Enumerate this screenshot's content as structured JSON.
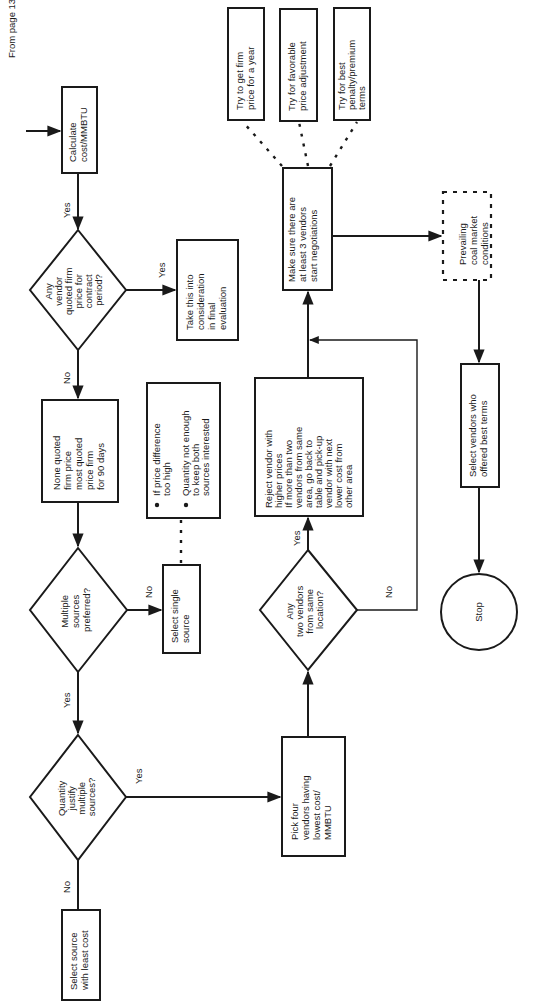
{
  "flowchart": {
    "entry_label": "From page 133",
    "nodes": {
      "calculate": [
        "Calculate",
        "cost/MMBTU"
      ],
      "any_vendor_firm": [
        "Any",
        "vendor",
        "quoted firm",
        "price for",
        "contract",
        "period?"
      ],
      "take_into_consideration": [
        "Take this into",
        "consideration",
        "in final",
        "evaluation"
      ],
      "none_quoted": [
        "None quoted",
        "firm price",
        "most quoted",
        "price firm",
        "for 90 days"
      ],
      "reasons": [
        "If price difference",
        "too high",
        "Quantity not enough",
        "to keep both",
        "sources interested"
      ],
      "multiple_preferred": [
        "Multiple",
        "sources",
        "preferred?"
      ],
      "select_single": [
        "Select single",
        "source"
      ],
      "quantity_justify": [
        "Quantity",
        "justify",
        "multiple",
        "sources?"
      ],
      "select_least_cost": [
        "Select source",
        "with least cost"
      ],
      "pick_four": [
        "Pick four",
        "vendors having",
        "lowest cost/",
        "MMBTU"
      ],
      "any_two_same": [
        "Any",
        "two vendors",
        "from same",
        "location?"
      ],
      "reject_vendor": [
        "Reject vendor with",
        "higher prices",
        "If more than two",
        "vendors from same",
        "area, go back to",
        "table and pick-up",
        "vendor with next",
        "lower cost from",
        "other area"
      ],
      "make_sure": [
        "Make sure there are",
        "at least 3 vendors",
        "start negotiations"
      ],
      "try_firm_price": [
        "Try to get firm",
        "price for a year"
      ],
      "try_price_adjustment": [
        "Try for favorable",
        "price adjustment"
      ],
      "try_penalty_terms": [
        "Try for best",
        "penalty/premium",
        "terms"
      ],
      "prevailing_market": [
        "Prevailing",
        "coal market",
        "conditions"
      ],
      "select_best_terms": [
        "Select vendors who",
        "offered best terms"
      ],
      "stop": [
        "Stop"
      ]
    },
    "edge_labels": {
      "yes": "Yes",
      "no": "No"
    }
  }
}
